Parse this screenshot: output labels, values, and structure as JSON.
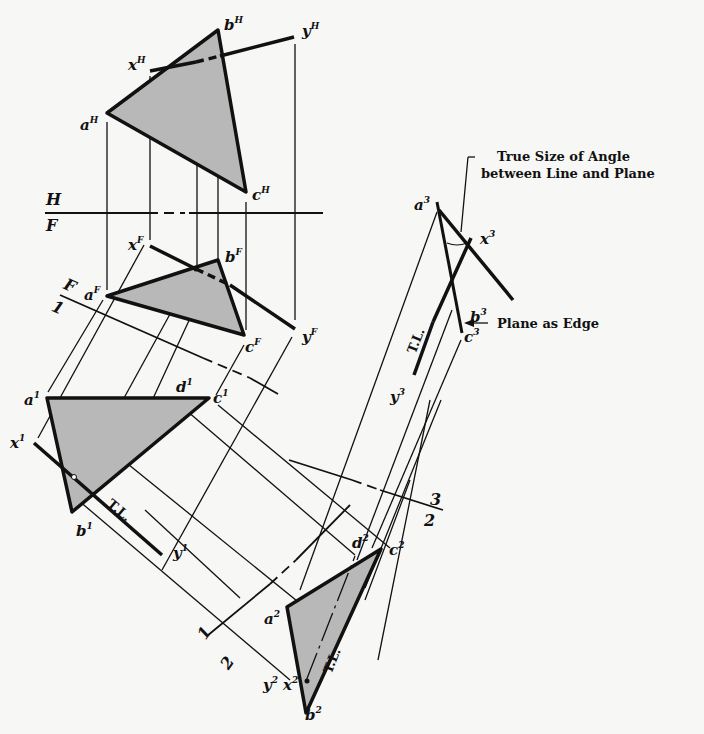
{
  "annotations": {
    "true_size_line1": "True Size of Angle",
    "true_size_line2": "between Line and Plane",
    "plane_as_edge": "Plane as Edge",
    "true_length": "T.L."
  },
  "fold_lines": {
    "HF": {
      "upper": "H",
      "lower": "F"
    },
    "F1": {
      "upper": "F",
      "lower": "1"
    },
    "12": {
      "upper": "1",
      "lower": "2"
    },
    "23": {
      "upper": "3",
      "lower": "2"
    }
  },
  "points": {
    "aH": {
      "base": "a",
      "sup": "H"
    },
    "bH": {
      "base": "b",
      "sup": "H"
    },
    "cH": {
      "base": "c",
      "sup": "H"
    },
    "xH": {
      "base": "x",
      "sup": "H"
    },
    "yH": {
      "base": "y",
      "sup": "H"
    },
    "aF": {
      "base": "a",
      "sup": "F"
    },
    "bF": {
      "base": "b",
      "sup": "F"
    },
    "cF": {
      "base": "c",
      "sup": "F"
    },
    "xF": {
      "base": "x",
      "sup": "F"
    },
    "yF": {
      "base": "y",
      "sup": "F"
    },
    "a1": {
      "base": "a",
      "sup": "1"
    },
    "b1": {
      "base": "b",
      "sup": "1"
    },
    "c1": {
      "base": "c",
      "sup": "1"
    },
    "d1": {
      "base": "d",
      "sup": "1"
    },
    "x1": {
      "base": "x",
      "sup": "1"
    },
    "y1": {
      "base": "y",
      "sup": "1"
    },
    "a2": {
      "base": "a",
      "sup": "2"
    },
    "b2": {
      "base": "b",
      "sup": "2"
    },
    "c2": {
      "base": "c",
      "sup": "2"
    },
    "d2": {
      "base": "d",
      "sup": "2"
    },
    "x2": {
      "base": "x",
      "sup": "2"
    },
    "y2": {
      "base": "y",
      "sup": "2"
    },
    "a3": {
      "base": "a",
      "sup": "3"
    },
    "b3": {
      "base": "b",
      "sup": "3"
    },
    "c3": {
      "base": "c",
      "sup": "3"
    },
    "x3": {
      "base": "x",
      "sup": "3"
    },
    "y3": {
      "base": "y",
      "sup": "3"
    }
  },
  "colors": {
    "ink": "#111111",
    "fill": "#b8b8b8",
    "paper": "#f7f7f5"
  }
}
